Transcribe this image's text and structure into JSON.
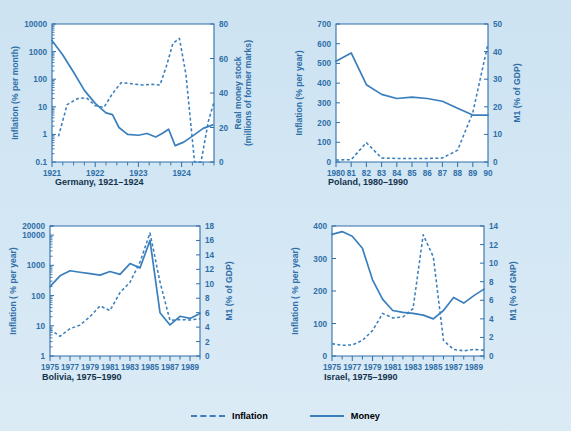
{
  "figure": {
    "background_color": "#d4e7f4",
    "series_color": "#3a7fbd",
    "axis_color": "#2f6fa8",
    "caption_color": "#13324c"
  },
  "legend": {
    "inflation_label": "Inflation",
    "money_label": "Money"
  },
  "chart_data": [
    {
      "id": "germany",
      "type": "line",
      "title": "Germany, 1921–1924",
      "ylabel": "Inflation (% per month)",
      "ylabel_right": "Real money stock\n(millions of former marks)",
      "ylabel_right_line1": "Real money stock",
      "ylabel_right_line2": "(millions of former marks)",
      "xlabel": "",
      "yscale": "log",
      "ylim": [
        0.1,
        10000
      ],
      "yticks": [
        0.1,
        1,
        10,
        100,
        1000,
        10000
      ],
      "yticklabels": [
        "0.1",
        "1",
        "10",
        "100",
        "1000",
        "10000"
      ],
      "ylim_right": [
        0,
        80
      ],
      "yticks_right": [
        0,
        20,
        40,
        60,
        80
      ],
      "yticklabels_right": [
        "0",
        "20",
        "40",
        "60",
        "80"
      ],
      "xlim": [
        1921.0,
        1924.75
      ],
      "xticks": [
        1921,
        1922,
        1923,
        1924
      ],
      "xticklabels": [
        "1921",
        "1922",
        "1923",
        "1924"
      ],
      "grid": false,
      "legend_position": "figure-bottom",
      "series": [
        {
          "name": "Money",
          "style": "solid",
          "axis": "right",
          "x": [
            1921.0,
            1921.25,
            1921.5,
            1921.75,
            1922.0,
            1922.25,
            1922.4,
            1922.55,
            1922.75,
            1923.0,
            1923.2,
            1923.4,
            1923.55,
            1923.7,
            1923.85,
            1924.05,
            1924.25,
            1924.5,
            1924.72
          ],
          "values": [
            70.5,
            62.0,
            52.0,
            41.5,
            34.0,
            28.5,
            27.5,
            20.0,
            16.0,
            15.5,
            16.5,
            14.5,
            16.5,
            19.0,
            9.5,
            11.5,
            15.0,
            19.5,
            21.5
          ]
        },
        {
          "name": "Inflation",
          "style": "dashed",
          "axis": "left",
          "x": [
            1921.15,
            1921.35,
            1921.6,
            1921.8,
            1922.0,
            1922.2,
            1922.4,
            1922.6,
            1922.85,
            1923.1,
            1923.3,
            1923.5,
            1923.65,
            1923.8,
            1923.95,
            1924.1,
            1924.3,
            1924.45,
            1924.62,
            1924.75
          ],
          "values": [
            0.85,
            12.0,
            20.0,
            21.0,
            11.0,
            9.5,
            30.0,
            75.0,
            68.0,
            62.0,
            65.0,
            62.0,
            300.0,
            2000.0,
            3000.0,
            150.0,
            0.1,
            0.1,
            3.0,
            15.0
          ]
        }
      ]
    },
    {
      "id": "poland",
      "type": "line",
      "title": "Poland, 1980–1990",
      "ylabel": "Inflation (% per year)",
      "ylabel_right": "M1 (% of GDP)",
      "xlabel": "",
      "yscale": "linear",
      "ylim": [
        0,
        700
      ],
      "yticks": [
        0,
        100,
        200,
        300,
        400,
        500,
        600,
        700
      ],
      "yticklabels": [
        "0",
        "100",
        "200",
        "300",
        "400",
        "500",
        "600",
        "700"
      ],
      "ylim_right": [
        0,
        50
      ],
      "yticks_right": [
        0,
        10,
        20,
        30,
        40,
        50
      ],
      "yticklabels_right": [
        "0",
        "10",
        "20",
        "30",
        "40",
        "50"
      ],
      "xlim": [
        1980,
        1990
      ],
      "xticks": [
        1980,
        1981,
        1982,
        1983,
        1984,
        1985,
        1986,
        1987,
        1988,
        1989,
        1990
      ],
      "xticklabels": [
        "1980",
        "81",
        "82",
        "83",
        "84",
        "85",
        "86",
        "87",
        "88",
        "89",
        "90"
      ],
      "grid": false,
      "series": [
        {
          "name": "Money",
          "style": "solid",
          "axis": "right",
          "x": [
            1980,
            1981,
            1982,
            1983,
            1984,
            1985,
            1986,
            1987,
            1988,
            1989,
            1990
          ],
          "values": [
            36.5,
            39.5,
            28.0,
            24.5,
            23.0,
            23.5,
            23.0,
            22.0,
            19.5,
            17.0,
            17.0
          ]
        },
        {
          "name": "Inflation",
          "style": "dashed",
          "axis": "left",
          "x": [
            1980,
            1981,
            1982,
            1983,
            1984,
            1985,
            1986,
            1987,
            1988,
            1989,
            1990
          ],
          "values": [
            10,
            12,
            98,
            20,
            18,
            18,
            18,
            20,
            60,
            250,
            600
          ]
        }
      ]
    },
    {
      "id": "bolivia",
      "type": "line",
      "title": "Bolivia, 1975–1990",
      "ylabel": "Inflation ( % per year)",
      "ylabel_right": "M1 (% of GDP)",
      "xlabel": "",
      "yscale": "log",
      "ylim": [
        1,
        20000
      ],
      "yticks": [
        1,
        10,
        100,
        1000,
        10000,
        20000
      ],
      "yticklabels": [
        "1",
        "10",
        "100",
        "1000",
        "10000",
        "20000"
      ],
      "ylim_right": [
        0,
        18
      ],
      "yticks_right": [
        0,
        2,
        4,
        6,
        8,
        10,
        12,
        14,
        16,
        18
      ],
      "yticklabels_right": [
        "0",
        "2",
        "4",
        "6",
        "8",
        "10",
        "12",
        "14",
        "16",
        "18"
      ],
      "xlim": [
        1975,
        1990
      ],
      "xticks": [
        1975,
        1976,
        1977,
        1978,
        1979,
        1980,
        1981,
        1982,
        1983,
        1984,
        1985,
        1986,
        1987,
        1988,
        1989,
        1990
      ],
      "xticklabels": [
        "1975",
        "",
        "1977",
        "",
        "1979",
        "",
        "1981",
        "",
        "1983",
        "",
        "1985",
        "",
        "1987",
        "",
        "1989",
        ""
      ],
      "grid": false,
      "series": [
        {
          "name": "Money",
          "style": "solid",
          "axis": "right",
          "x": [
            1975,
            1976,
            1977,
            1978,
            1979,
            1980,
            1981,
            1982,
            1983,
            1984,
            1985,
            1986,
            1987,
            1988,
            1989,
            1990
          ],
          "values": [
            9.6,
            11.1,
            11.8,
            11.6,
            11.4,
            11.2,
            11.7,
            11.3,
            12.8,
            12.2,
            16.0,
            6.0,
            4.3,
            5.5,
            5.2,
            5.9
          ]
        },
        {
          "name": "Inflation",
          "style": "dashed",
          "axis": "left",
          "x": [
            1975,
            1976,
            1977,
            1978,
            1979,
            1980,
            1981,
            1982,
            1983,
            1984,
            1985,
            1986,
            1987,
            1988,
            1989,
            1990
          ],
          "values": [
            7.5,
            4.5,
            8.0,
            10.5,
            20.0,
            45.0,
            32.0,
            125.0,
            275.0,
            1280.0,
            11800.0,
            280.0,
            15.0,
            16.0,
            15.5,
            17.0
          ]
        }
      ]
    },
    {
      "id": "israel",
      "type": "line",
      "title": "Israel, 1975–1990",
      "ylabel": "Inflation ( % per year)",
      "ylabel_right": "M1 (% of GNP)",
      "xlabel": "",
      "yscale": "linear",
      "ylim": [
        0,
        400
      ],
      "yticks": [
        0,
        100,
        200,
        300,
        400
      ],
      "yticklabels": [
        "0",
        "100",
        "200",
        "300",
        "400"
      ],
      "ylim_right": [
        0,
        14
      ],
      "yticks_right": [
        0,
        2,
        4,
        6,
        8,
        10,
        12,
        14
      ],
      "yticklabels_right": [
        "0",
        "2",
        "4",
        "6",
        "8",
        "10",
        "12",
        "14"
      ],
      "xlim": [
        1975,
        1990
      ],
      "xticks": [
        1975,
        1976,
        1977,
        1978,
        1979,
        1980,
        1981,
        1982,
        1983,
        1984,
        1985,
        1986,
        1987,
        1988,
        1989,
        1990
      ],
      "xticklabels": [
        "1975",
        "",
        "1977",
        "",
        "1979",
        "",
        "1981",
        "",
        "1983",
        "",
        "1985",
        "",
        "1987",
        "",
        "1989",
        ""
      ],
      "grid": false,
      "series": [
        {
          "name": "Money",
          "style": "solid",
          "axis": "right",
          "x": [
            1975,
            1976,
            1977,
            1978,
            1979,
            1980,
            1981,
            1982,
            1983,
            1984,
            1985,
            1986,
            1987,
            1988,
            1989,
            1990
          ],
          "values": [
            13.1,
            13.4,
            12.9,
            11.6,
            8.2,
            6.1,
            4.9,
            4.7,
            4.6,
            4.4,
            4.0,
            4.9,
            6.3,
            5.7,
            6.5,
            7.2
          ]
        },
        {
          "name": "Inflation",
          "style": "dashed",
          "axis": "left",
          "x": [
            1975,
            1976,
            1977,
            1978,
            1979,
            1980,
            1981,
            1982,
            1983,
            1984,
            1985,
            1986,
            1987,
            1988,
            1989,
            1990
          ],
          "values": [
            38,
            33,
            34,
            48,
            78,
            131,
            117,
            120,
            146,
            373,
            305,
            48,
            20,
            16,
            20,
            18
          ]
        }
      ]
    }
  ]
}
